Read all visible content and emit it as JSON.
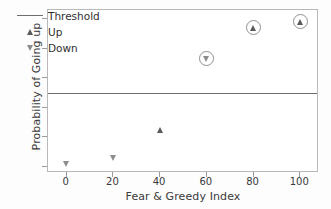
{
  "chart_data": {
    "type": "scatter",
    "title": "",
    "xlabel": "Fear & Greedy Index",
    "ylabel": "Probability of Going up",
    "xlim": [
      -8,
      108
    ],
    "ylim": [
      -0.04,
      1.06
    ],
    "xticks": [
      "0",
      "20",
      "40",
      "60",
      "80",
      "100"
    ],
    "xtick_values": [
      0,
      20,
      40,
      60,
      80,
      100
    ],
    "yticks": [
      "0.0",
      "0.2",
      "0.4",
      "0.6",
      "0.8",
      "1.0"
    ],
    "ytick_values": [
      0.0,
      0.2,
      0.4,
      0.6,
      0.8,
      1.0
    ],
    "grid": false,
    "legend_position": "upper left",
    "threshold": {
      "label": "Threshold",
      "value": 0.5,
      "color": "#6e6e6e"
    },
    "series": [
      {
        "name": "Up",
        "marker": "triangle-up",
        "color": "#5a5a5a",
        "points": [
          {
            "x": 40,
            "y": 0.25,
            "highlighted": false
          },
          {
            "x": 80,
            "y": 0.94,
            "highlighted": true
          },
          {
            "x": 100,
            "y": 0.98,
            "highlighted": true
          }
        ]
      },
      {
        "name": "Down",
        "marker": "triangle-down",
        "color": "#8d8d8d",
        "points": [
          {
            "x": 0,
            "y": 0.02,
            "highlighted": false
          },
          {
            "x": 20,
            "y": 0.06,
            "highlighted": false
          },
          {
            "x": 60,
            "y": 0.73,
            "highlighted": true
          }
        ]
      }
    ],
    "legend_entries": [
      {
        "label": "Threshold",
        "kind": "line"
      },
      {
        "label": "Up",
        "kind": "triangle-up"
      },
      {
        "label": "Down",
        "kind": "triangle-down"
      }
    ]
  }
}
